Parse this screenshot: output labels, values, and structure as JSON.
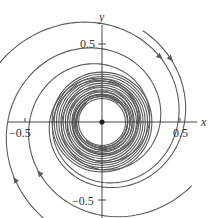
{
  "figure": {
    "type": "phase-portrait",
    "axes": {
      "x_label": "x",
      "y_label": "y",
      "x_ticks": [
        {
          "value": -0.5,
          "label": "−0.5"
        },
        {
          "value": 0.5,
          "label": "0.5"
        }
      ],
      "y_ticks": [
        {
          "value": 0.5,
          "label": "0.5"
        },
        {
          "value": -0.5,
          "label": "−0.5"
        }
      ]
    },
    "equilibrium": {
      "x": 0,
      "y": 0,
      "marker": "filled-dot"
    },
    "limit_cycle_radius_approx": 0.15,
    "trajectory_direction": "clockwise",
    "colors": {
      "curve": "#555555",
      "axis": "#333333",
      "background": "#ffffff"
    }
  }
}
